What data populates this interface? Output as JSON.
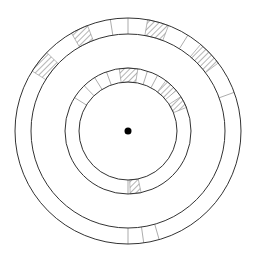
{
  "diagram": {
    "center": [
      128,
      131
    ],
    "stroke_color": "#333333",
    "divider_color": "#888888",
    "hatch_color": "#444444",
    "background": "#ffffff",
    "center_dot_radius": 3.5,
    "rings": [
      {
        "name": "outer-ring",
        "r_outer": 113,
        "r_inner": 97,
        "dividers_deg": [
          -9,
          0,
          32,
          70,
          164,
          172,
          180
        ],
        "hatched_segments_deg": [
          [
            -58,
            -46
          ],
          [
            -30,
            -21
          ],
          [
            10,
            21
          ],
          [
            40,
            53
          ]
        ]
      },
      {
        "name": "inner-ring",
        "r_outer": 63,
        "r_inner": 49,
        "dividers_deg": [
          -58,
          -44,
          -32,
          -20,
          18,
          28,
          180
        ],
        "hatched_segments_deg": [
          [
            -8,
            9
          ],
          [
            37,
            50
          ],
          [
            57,
            68
          ],
          [
            168,
            178
          ]
        ]
      }
    ]
  }
}
